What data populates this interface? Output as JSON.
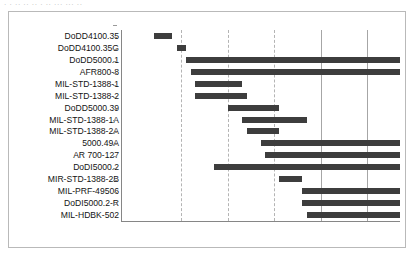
{
  "top_strip_text": "· · ·· ·· ·· · ·· ··· ··· ··",
  "axis": {
    "ticks": [
      "1960",
      "1970",
      "1980",
      "1990",
      "2000",
      "2010"
    ],
    "tick_values": [
      1960,
      1970,
      1980,
      1990,
      2000,
      2010
    ]
  },
  "chart_data": {
    "type": "bar",
    "subtype": "gantt-timeline",
    "title": "",
    "xlabel": "",
    "ylabel": "",
    "xlim": [
      1957,
      2017
    ],
    "grid": true,
    "gridlines_dashed": [
      1970,
      1980,
      1990
    ],
    "gridlines_solid": [
      2000,
      2010
    ],
    "legend": "none",
    "bar_color": "#3d3d3d",
    "categories": [
      "DoDD4100.35",
      "DoDD4100.35G",
      "DoDD5000.1",
      "AFR800-8",
      "MIL-STD-1388-1",
      "MIL-STD-1388-2",
      "DoDD5000.39",
      "MIL-STD-1388-1A",
      "MIL-STD-1388-2A",
      "5000.49A",
      "AR 700-127",
      "DoDI5000.2",
      "MIR-STD-1388-2B",
      "MIL-PRF-49506",
      "DoDI5000.2-R",
      "MIL-HDBK-502"
    ],
    "bars": [
      {
        "label": "DoDD4100.35",
        "start": 1964,
        "end": 1968
      },
      {
        "label": "DoDD4100.35G",
        "start": 1969,
        "end": 1971
      },
      {
        "label": "DoDD5000.1",
        "start": 1971,
        "end": 2017
      },
      {
        "label": "AFR800-8",
        "start": 1972,
        "end": 2017
      },
      {
        "label": "MIL-STD-1388-1",
        "start": 1973,
        "end": 1983
      },
      {
        "label": "MIL-STD-1388-2",
        "start": 1973,
        "end": 1984
      },
      {
        "label": "DoDD5000.39",
        "start": 1980,
        "end": 1991
      },
      {
        "label": "MIL-STD-1388-1A",
        "start": 1983,
        "end": 1997
      },
      {
        "label": "MIL-STD-1388-2A",
        "start": 1984,
        "end": 1991
      },
      {
        "label": "5000.49A",
        "start": 1987,
        "end": 2017
      },
      {
        "label": "AR 700-127",
        "start": 1988,
        "end": 2017
      },
      {
        "label": "DoDI5000.2",
        "start": 1977,
        "end": 2017
      },
      {
        "label": "MIR-STD-1388-2B",
        "start": 1991,
        "end": 1996
      },
      {
        "label": "MIL-PRF-49506",
        "start": 1996,
        "end": 2017
      },
      {
        "label": "DoDI5000.2-R",
        "start": 1996,
        "end": 2017
      },
      {
        "label": "MIL-HDBK-502",
        "start": 1997,
        "end": 2017
      }
    ]
  }
}
